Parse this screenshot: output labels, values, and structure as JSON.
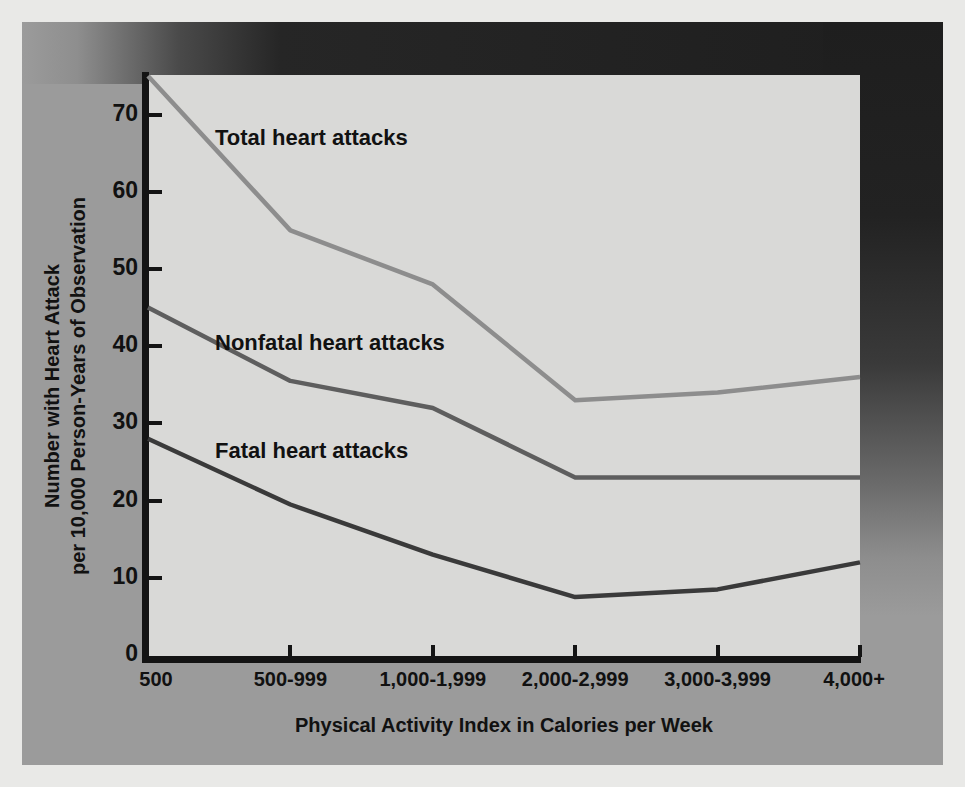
{
  "figure": {
    "panel_bg": "#9b9b9b",
    "plot_bg": "#d9d9d7",
    "axis_color": "#141414"
  },
  "chart_data": {
    "type": "line",
    "title": "",
    "xlabel": "Physical Activity Index in Calories per Week",
    "ylabel_line1": "Number with Heart Attack",
    "ylabel_line2": "per 10,000 Person-Years of Observation",
    "categories": [
      "500",
      "500-999",
      "1,000-1,999",
      "2,000-2,999",
      "3,000-3,999",
      "4,000+"
    ],
    "ylim": [
      0,
      78
    ],
    "yticks": [
      0,
      10,
      20,
      30,
      40,
      50,
      60,
      70
    ],
    "ytick_labels": [
      "0",
      "10",
      "20",
      "30",
      "40",
      "50",
      "60",
      "70"
    ],
    "grid": false,
    "legend": "inline-annotations",
    "series": [
      {
        "name": "Total heart attacks",
        "color": "#8d8d8d",
        "values": [
          75,
          55,
          48,
          33,
          34,
          36
        ]
      },
      {
        "name": "Nonfatal heart attacks",
        "color": "#5e5e5e",
        "values": [
          45,
          35.5,
          32,
          23,
          23,
          23
        ]
      },
      {
        "name": "Fatal heart attacks",
        "color": "#3a3a3a",
        "values": [
          28,
          19.5,
          13,
          7.5,
          8.5,
          12
        ]
      }
    ],
    "annotations": [
      {
        "text": "Total heart attacks",
        "x": 215,
        "y": 125
      },
      {
        "text": "Nonfatal heart attacks",
        "x": 215,
        "y": 330
      },
      {
        "text": "Fatal heart attacks",
        "x": 215,
        "y": 438
      }
    ]
  }
}
